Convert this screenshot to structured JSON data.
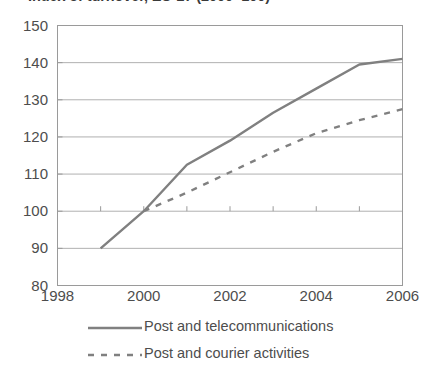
{
  "chart_data": {
    "type": "line",
    "title": "Index of turnover, EU-27 (2000=100)",
    "xlabel": "",
    "ylabel": "",
    "xlim": [
      1998,
      2006
    ],
    "ylim": [
      80,
      150
    ],
    "ytick_step": 10,
    "grid": "horizontal",
    "legend_position": "bottom",
    "background_color": "#ffffff",
    "line_color": "#808080",
    "text_color": "#4d4d4d",
    "y_ticks": [
      "150",
      "140",
      "130",
      "120",
      "110",
      "100",
      "90",
      "80"
    ],
    "x_ticks": [
      "1998",
      "2000",
      "2002",
      "2004",
      "2006"
    ],
    "x_minor_years": [
      1998,
      1999,
      2000,
      2001,
      2002,
      2003,
      2004,
      2005,
      2006
    ],
    "series": [
      {
        "name": "Post and telecommunications",
        "style": "solid",
        "color": "#808080",
        "x": [
          1999,
          2000,
          2001,
          2002,
          2003,
          2004,
          2005,
          2006
        ],
        "values": [
          90,
          100,
          112.5,
          119,
          126.5,
          133,
          139.5,
          141
        ]
      },
      {
        "name": "Post and courier activities",
        "style": "dashed",
        "color": "#808080",
        "x": [
          2000,
          2001,
          2002,
          2003,
          2004,
          2005,
          2006
        ],
        "values": [
          100,
          105,
          110.5,
          116,
          121,
          124.5,
          127.5
        ]
      }
    ]
  }
}
